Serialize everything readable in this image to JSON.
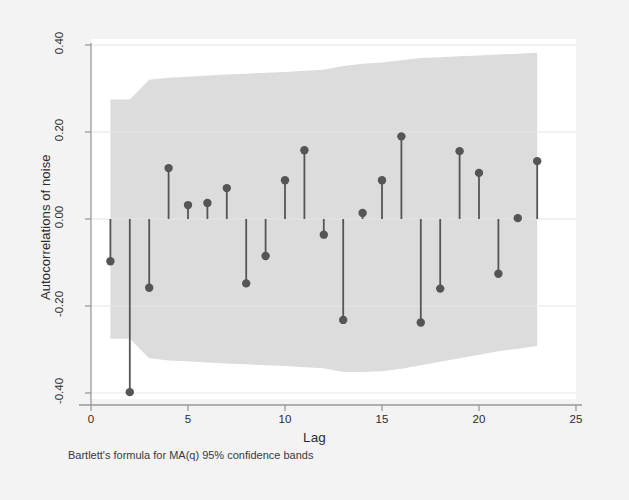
{
  "chart_data": {
    "type": "bar",
    "title": "",
    "subtitle": "",
    "xlabel": "Lag",
    "ylabel": "Autocorrelations of noise",
    "note": "Bartlett's formula for MA(q) 95% confidence bands",
    "grid": true,
    "legend": null,
    "xlim": [
      0,
      25
    ],
    "ylim": [
      -0.4,
      0.4
    ],
    "xticks": [
      0,
      5,
      10,
      15,
      20,
      25
    ],
    "xticklabels": [
      "0",
      "5",
      "10",
      "15",
      "20",
      "25"
    ],
    "yticks": [
      0.4,
      0.2,
      0.0,
      -0.2,
      -0.4
    ],
    "yticklabels": [
      "0.40",
      "0.20",
      "0.00",
      "-0.20",
      "-0.40"
    ],
    "categories": [
      1,
      2,
      3,
      4,
      5,
      6,
      7,
      8,
      9,
      10,
      11,
      12,
      13,
      14,
      15,
      16,
      17,
      18,
      19,
      20,
      21,
      22,
      23
    ],
    "values": [
      -0.097,
      -0.398,
      -0.158,
      0.117,
      0.032,
      0.037,
      0.071,
      -0.148,
      -0.085,
      0.089,
      0.158,
      -0.036,
      -0.232,
      0.014,
      0.089,
      0.19,
      -0.238,
      -0.16,
      0.156,
      0.106,
      -0.126,
      0.002,
      0.133
    ],
    "series": [
      {
        "name": "Autocorrelation",
        "values": [
          -0.097,
          -0.398,
          -0.158,
          0.117,
          0.032,
          0.037,
          0.071,
          -0.148,
          -0.085,
          0.089,
          0.158,
          -0.036,
          -0.232,
          0.014,
          0.089,
          0.19,
          -0.238,
          -0.16,
          0.156,
          0.106,
          -0.126,
          0.002,
          0.133
        ]
      }
    ],
    "confidence_band": {
      "label": "95% confidence band",
      "upper": [
        0.275,
        0.275,
        0.32,
        0.325,
        0.327,
        0.33,
        0.332,
        0.334,
        0.336,
        0.338,
        0.341,
        0.343,
        0.352,
        0.357,
        0.36,
        0.365,
        0.37,
        0.372,
        0.374,
        0.376,
        0.378,
        0.38,
        0.382
      ],
      "lower": [
        -0.275,
        -0.275,
        -0.32,
        -0.325,
        -0.327,
        -0.33,
        -0.332,
        -0.334,
        -0.336,
        -0.338,
        -0.341,
        -0.343,
        -0.352,
        -0.352,
        -0.35,
        -0.344,
        -0.336,
        -0.328,
        -0.32,
        -0.312,
        -0.304,
        -0.298,
        -0.292
      ]
    },
    "colors": {
      "background": "#f3f3f3",
      "plot_background": "#ffffff",
      "band": "#dcdcdc",
      "marker": "#555555",
      "stem": "#555555",
      "axis": "#999999",
      "grid": "#e6e6e6",
      "text": "#2b2b2b"
    }
  },
  "axes": {
    "ylabel": "Autocorrelations of noise",
    "xlabel": "Lag",
    "note": "Bartlett's formula for MA(q) 95% confidence bands"
  },
  "ticks": {
    "y": [
      "0.40",
      "0.20",
      "0.00",
      "-0.20",
      "-0.40"
    ],
    "x": [
      "0",
      "5",
      "10",
      "15",
      "20",
      "25"
    ]
  }
}
